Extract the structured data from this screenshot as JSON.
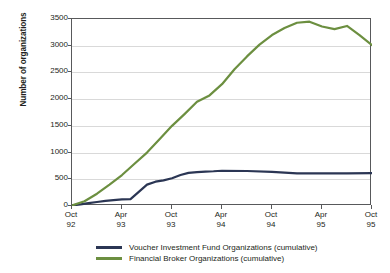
{
  "chart_data": {
    "type": "line",
    "title": "",
    "xlabel": "",
    "ylabel": "Number of organizations",
    "ylim": [
      0,
      3500
    ],
    "ytick_values": [
      0,
      500,
      1000,
      1500,
      2000,
      2500,
      3000,
      3500
    ],
    "ytick_labels": [
      "0",
      "500",
      "1000",
      "1500",
      "2000",
      "2500",
      "3000",
      "3500"
    ],
    "categories": [
      "Oct 92",
      "Apr 93",
      "Oct 93",
      "Apr 94",
      "Oct 94",
      "Apr 95",
      "Oct 95"
    ],
    "xtick_labels": [
      {
        "line1": "Oct",
        "line2": "92"
      },
      {
        "line1": "Apr",
        "line2": "93"
      },
      {
        "line1": "Oct",
        "line2": "93"
      },
      {
        "line1": "Apr",
        "line2": "94"
      },
      {
        "line1": "Oct",
        "line2": "94"
      },
      {
        "line1": "Apr",
        "line2": "95"
      },
      {
        "line1": "Oct",
        "line2": "95"
      }
    ],
    "grid": "horizontal",
    "legend_position": "bottom",
    "series": [
      {
        "name": "Voucher Investment Fund Organizations (cumulative)",
        "color": "#2b3654",
        "x": [
          0,
          0.17,
          0.33,
          0.5,
          0.67,
          0.83,
          1.0,
          1.17,
          1.33,
          1.5,
          1.67,
          1.83,
          2.0,
          2.17,
          2.33,
          2.5,
          2.67,
          2.83,
          3.0,
          3.5,
          4.0,
          4.5,
          5.0,
          5.5,
          6.0
        ],
        "values": [
          10,
          30,
          55,
          75,
          95,
          110,
          125,
          130,
          260,
          400,
          455,
          480,
          520,
          580,
          620,
          635,
          645,
          650,
          660,
          655,
          640,
          612,
          610,
          612,
          615
        ]
      },
      {
        "name": "Financial Broker Organizations (cumulative)",
        "color": "#6c8f40",
        "x": [
          0,
          0.25,
          0.5,
          0.75,
          1.0,
          1.25,
          1.5,
          1.75,
          2.0,
          2.25,
          2.5,
          2.75,
          3.0,
          3.25,
          3.5,
          3.75,
          4.0,
          4.25,
          4.5,
          4.75,
          5.0,
          5.25,
          5.5,
          5.75,
          6.0
        ],
        "values": [
          10,
          90,
          230,
          400,
          580,
          790,
          1000,
          1250,
          1500,
          1720,
          1950,
          2070,
          2280,
          2560,
          2800,
          3020,
          3200,
          3330,
          3430,
          3450,
          3360,
          3310,
          3370,
          3200,
          3010
        ]
      }
    ],
    "legend_entries": [
      {
        "label": "Voucher Investment Fund Organizations (cumulative)",
        "color": "#2b3654"
      },
      {
        "label": "Financial Broker Organizations (cumulative)",
        "color": "#6c8f40"
      }
    ]
  }
}
